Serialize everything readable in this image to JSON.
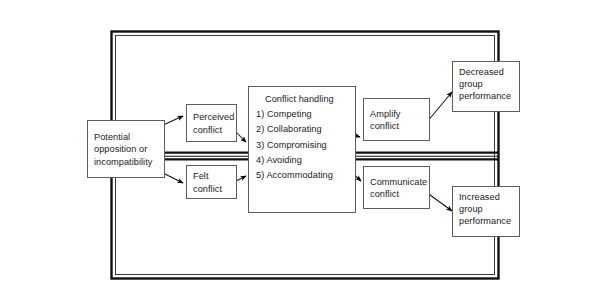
{
  "diagram": {
    "frame": {
      "name": "outer-frame",
      "style": "double-line-rectangle",
      "divider": "double-line-horizontal"
    },
    "colors": {
      "line": "#000000",
      "box_border": "#5d5d5d",
      "background": "#ffffff",
      "text": "#1b1b1b"
    },
    "nodes": {
      "potential": {
        "lines": [
          "Potential",
          "opposition or",
          "incompatibility"
        ]
      },
      "perceived": {
        "lines": [
          "Perceived",
          "conflict"
        ]
      },
      "felt": {
        "lines": [
          "Felt",
          "conflict"
        ]
      },
      "conflict_handling": {
        "title": "Conflict handling",
        "options": [
          {
            "num": "1)",
            "label": "Competing"
          },
          {
            "num": "2)",
            "label": "Collaborating"
          },
          {
            "num": "3)",
            "label": "Compromising"
          },
          {
            "num": "4)",
            "label": "Avoiding"
          },
          {
            "num": "5)",
            "label": "Accommodating"
          }
        ]
      },
      "amplify": {
        "lines": [
          "Amplify",
          "conflict"
        ]
      },
      "communicate": {
        "lines": [
          "Communicate",
          "conflict"
        ]
      },
      "decreased": {
        "lines": [
          "Decreased",
          "group",
          "performance"
        ]
      },
      "increased": {
        "lines": [
          "Increased",
          "group",
          "performance"
        ]
      }
    },
    "edges": [
      {
        "name": "potential-to-perceived",
        "from": "potential",
        "to": "perceived"
      },
      {
        "name": "potential-to-felt",
        "from": "potential",
        "to": "felt"
      },
      {
        "name": "perceived-to-conflict-handling",
        "from": "perceived",
        "to": "conflict_handling"
      },
      {
        "name": "felt-to-conflict-handling",
        "from": "felt",
        "to": "conflict_handling"
      },
      {
        "name": "conflict-handling-to-amplify",
        "from": "conflict_handling",
        "to": "amplify"
      },
      {
        "name": "conflict-handling-to-communicate",
        "from": "conflict_handling",
        "to": "communicate"
      },
      {
        "name": "amplify-to-decreased",
        "from": "amplify",
        "to": "decreased"
      },
      {
        "name": "communicate-to-increased",
        "from": "communicate",
        "to": "increased"
      }
    ]
  }
}
